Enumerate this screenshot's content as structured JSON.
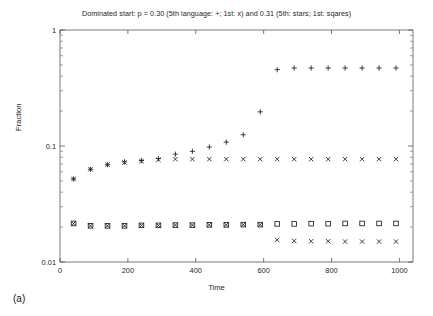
{
  "figure": {
    "panel_label": "(a)",
    "title": "Dominated start: p = 0.30 (5th language: +; 1st: x) and 0.31 (5th: stars; 1st: sqares)",
    "xlabel": "Time",
    "ylabel": "Fraction"
  },
  "axes": {
    "x_ticks": [
      "0",
      "200",
      "400",
      "600",
      "800",
      "1000"
    ],
    "y_ticks": [
      "0.01",
      "0.1",
      "1"
    ]
  },
  "chart_data": {
    "type": "scatter",
    "title": "Dominated start: p = 0.30 (5th language: +; 1st: x) and 0.31 (5th: stars; 1st: sqares)",
    "xlabel": "Time",
    "ylabel": "Fraction",
    "xlim": [
      0,
      1040
    ],
    "ylim": [
      0.01,
      1
    ],
    "yscale": "log",
    "xscale": "linear",
    "grid": false,
    "legend": "in-title",
    "series": [
      {
        "name": "5th language (p = 0.30)",
        "marker": "plus",
        "x": [
          40,
          90,
          140,
          190,
          240,
          290,
          340,
          390,
          440,
          490,
          540,
          590,
          640,
          690,
          740,
          790,
          840,
          890,
          940,
          990
        ],
        "y": [
          0.052,
          0.063,
          0.069,
          0.073,
          0.075,
          0.078,
          0.085,
          0.09,
          0.098,
          0.108,
          0.125,
          0.197,
          0.455,
          0.47,
          0.47,
          0.47,
          0.47,
          0.47,
          0.47,
          0.47
        ]
      },
      {
        "name": "1st language (p = 0.30)",
        "marker": "x-in-square",
        "x": [
          40,
          90,
          140,
          190,
          240,
          290,
          340,
          390,
          440,
          490,
          540,
          590,
          640,
          690,
          740,
          790,
          840,
          890,
          940,
          990
        ],
        "y": [
          0.052,
          0.063,
          0.069,
          0.072,
          0.074,
          0.076,
          0.077,
          0.077,
          0.077,
          0.077,
          0.077,
          0.077,
          0.077,
          0.077,
          0.077,
          0.077,
          0.077,
          0.077,
          0.077,
          0.077
        ]
      },
      {
        "name": "5th (p = 0.31, stars)",
        "marker": "star",
        "x": [
          40,
          90,
          140,
          190,
          240,
          290,
          340,
          390,
          440,
          490,
          540,
          590,
          640,
          690,
          740,
          790,
          840,
          890,
          940,
          990
        ],
        "y": [
          0.0215,
          0.0205,
          0.0205,
          0.0205,
          0.0207,
          0.0207,
          0.0208,
          0.0208,
          0.0209,
          0.0209,
          0.021,
          0.021,
          0.0155,
          0.0152,
          0.0151,
          0.0151,
          0.015,
          0.015,
          0.015,
          0.015
        ]
      },
      {
        "name": "1st (p = 0.31, squares)",
        "marker": "square",
        "x": [
          40,
          90,
          140,
          190,
          240,
          290,
          340,
          390,
          440,
          490,
          540,
          590,
          640,
          690,
          740,
          790,
          840,
          890,
          940,
          990
        ],
        "y": [
          0.0215,
          0.0205,
          0.0205,
          0.0205,
          0.0207,
          0.0207,
          0.0208,
          0.0208,
          0.0209,
          0.0209,
          0.021,
          0.021,
          0.0213,
          0.0213,
          0.0214,
          0.0214,
          0.0215,
          0.0215,
          0.0215,
          0.0215
        ]
      }
    ]
  }
}
